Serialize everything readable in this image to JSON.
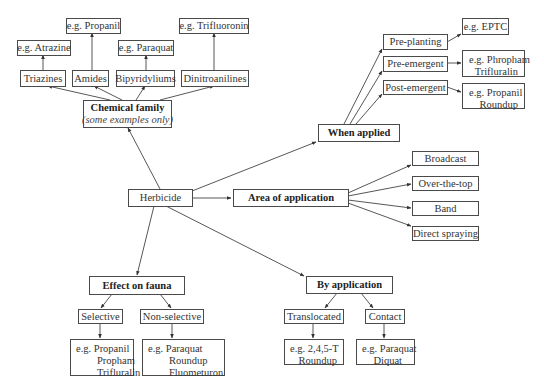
{
  "root": {
    "label": "Herbicide"
  },
  "chemical_family": {
    "title": "Chemical family",
    "subtitle": "(some examples only)",
    "children": [
      {
        "label": "Triazines",
        "example": "e.g. Atrazine"
      },
      {
        "label": "Amides",
        "example": "e.g. Propanil"
      },
      {
        "label": "Bipyridyliums",
        "example": "e.g. Paraquat"
      },
      {
        "label": "Dinitroanilines",
        "example": "e.g. Trifluoronin"
      }
    ]
  },
  "when_applied": {
    "title": "When applied",
    "children": [
      {
        "label": "Pre-planting",
        "example": [
          "e.g. EPTC"
        ]
      },
      {
        "label": "Pre-emergent",
        "example": [
          "e.g. Phropham",
          "Trifluralin"
        ]
      },
      {
        "label": "Post-emergent",
        "example": [
          "e.g. Propanil",
          "Roundup"
        ]
      }
    ]
  },
  "area_of_application": {
    "title": "Area of application",
    "children": [
      "Broadcast",
      "Over-the-top",
      "Band",
      "Direct spraying"
    ]
  },
  "effect_on_fauna": {
    "title": "Effect on fauna",
    "children": [
      {
        "label": "Selective",
        "example": [
          "e.g. Propanil",
          "Propham",
          "Trifluralin"
        ]
      },
      {
        "label": "Non-selective",
        "example": [
          "e.g. Paraquat",
          "Roundup",
          "Fluometuron"
        ]
      }
    ]
  },
  "by_application": {
    "title": "By application",
    "children": [
      {
        "label": "Translocated",
        "example": [
          "e.g. 2,4,5-T",
          "Roundup"
        ]
      },
      {
        "label": "Contact",
        "example": [
          "e.g. Paraquat",
          "Diquat"
        ]
      }
    ]
  },
  "colors": {
    "line": "#333333",
    "border": "#4a4a4a",
    "text": "#333333",
    "background": "#ffffff"
  }
}
